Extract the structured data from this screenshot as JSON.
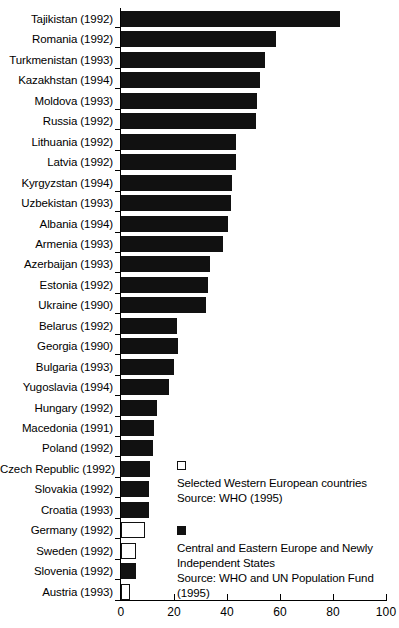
{
  "chart_data": {
    "type": "bar",
    "orientation": "horizontal",
    "title": "",
    "subtitle": "",
    "xlabel": "",
    "ylabel": "",
    "xlim": [
      0,
      100
    ],
    "xticks": [
      0,
      20,
      40,
      60,
      80,
      100
    ],
    "xticklabels": [
      "0",
      "20",
      "40",
      "60",
      "80",
      "100"
    ],
    "grid": false,
    "legend_position": "inside-lower-right",
    "categories": [
      "Tajikistan (1992)",
      "Romania (1992)",
      "Turkmenistan (1993)",
      "Kazakhstan (1994)",
      "Moldova (1993)",
      "Russia (1992)",
      "Lithuania (1992)",
      "Latvia (1992)",
      "Kyrgyzstan (1994)",
      "Uzbekistan (1993)",
      "Albania (1994)",
      "Armenia (1993)",
      "Azerbaijan (1993)",
      "Estonia (1992)",
      "Ukraine (1990)",
      "Belarus (1992)",
      "Georgia (1990)",
      "Bulgaria (1993)",
      "Yugoslavia (1994)",
      "Hungary (1992)",
      "Macedonia (1991)",
      "Poland (1992)",
      "Czech Republic (1992)",
      "Slovakia (1992)",
      "Croatia (1993)",
      "Germany (1992)",
      "Sweden (1992)",
      "Slovenia (1992)",
      "Austria (1993)"
    ],
    "values": [
      82.5,
      58.5,
      54.5,
      52.5,
      51.5,
      51.0,
      43.5,
      43.5,
      42.0,
      41.5,
      40.5,
      38.5,
      33.5,
      33.0,
      32.0,
      21.0,
      21.5,
      20.0,
      18.0,
      13.5,
      12.5,
      12.0,
      11.0,
      10.5,
      10.5,
      9.0,
      5.5,
      5.5,
      3.5
    ],
    "group": [
      "cee",
      "cee",
      "cee",
      "cee",
      "cee",
      "cee",
      "cee",
      "cee",
      "cee",
      "cee",
      "cee",
      "cee",
      "cee",
      "cee",
      "cee",
      "cee",
      "cee",
      "cee",
      "cee",
      "cee",
      "cee",
      "cee",
      "cee",
      "cee",
      "cee",
      "west",
      "west",
      "cee",
      "west"
    ],
    "colors": {
      "cee": "#111111",
      "west": "#ffffff",
      "outline": "#111111",
      "axis": "#000000"
    },
    "legend": [
      {
        "swatch": "hollow",
        "lines": [
          "Selected Western European countries",
          "Source: WHO (1995)"
        ]
      },
      {
        "swatch": "filled",
        "lines": [
          "Central and Eastern Europe and Newly",
          "Independent States",
          "Source: WHO and UN Population Fund",
          "(1995)"
        ]
      }
    ]
  }
}
